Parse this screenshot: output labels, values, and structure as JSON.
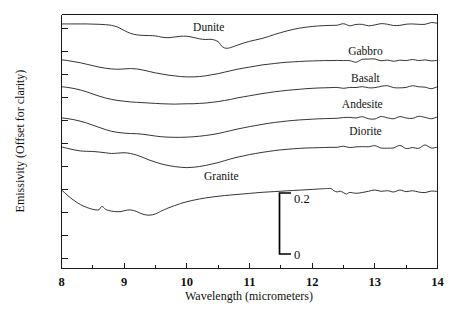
{
  "chart_data": {
    "type": "line",
    "title": "",
    "xlabel": "Wavelength (micrometers)",
    "ylabel": "Emissivity (Offset for clarity)",
    "xlim": [
      8,
      14
    ],
    "ylim": [
      0,
      1.4
    ],
    "grid": false,
    "legend_position": "inline-right",
    "xticks": [
      8,
      9,
      10,
      11,
      12,
      13,
      14
    ],
    "xtick_labels": [
      "8",
      "9",
      "10",
      "11",
      "12",
      "13",
      "14"
    ],
    "minor_xticks": [
      8.5,
      9.5,
      10.5,
      11.5,
      12.5,
      13.5
    ],
    "yticks_unlabeled": true,
    "scale_bar": {
      "top_label": "0.2",
      "bottom_label": "0",
      "span": 0.2,
      "x_position": 11.35
    },
    "annotations": [
      {
        "text": "Dunite",
        "x": 10.35,
        "y": 1.31
      },
      {
        "text": "Gabbro",
        "x": 12.85,
        "y": 1.175
      },
      {
        "text": "Basalt",
        "x": 12.85,
        "y": 1.03
      },
      {
        "text": "Andesite",
        "x": 12.8,
        "y": 0.885
      },
      {
        "text": "Diorite",
        "x": 12.85,
        "y": 0.735
      },
      {
        "text": "Granite",
        "x": 10.55,
        "y": 0.49
      }
    ],
    "series": [
      {
        "name": "Dunite",
        "color": "#111111",
        "offset": 1.2,
        "x": [
          8.0,
          8.1,
          8.2,
          8.3,
          8.4,
          8.5,
          8.6,
          8.7,
          8.8,
          8.9,
          9.0,
          9.1,
          9.2,
          9.3,
          9.4,
          9.5,
          9.6,
          9.7,
          9.8,
          9.9,
          10.0,
          10.1,
          10.2,
          10.3,
          10.4,
          10.5,
          10.55,
          10.6,
          10.65,
          10.7,
          10.8,
          10.9,
          11.0,
          11.1,
          11.2,
          11.3,
          11.4,
          11.5,
          11.6,
          11.7,
          11.8,
          11.9,
          12.0,
          12.1,
          12.2,
          12.3,
          12.4,
          12.5,
          12.6,
          12.7,
          12.8,
          12.9,
          13.0,
          13.1,
          13.2,
          13.3,
          13.4,
          13.5,
          13.6,
          13.7,
          13.8,
          13.9,
          14.0
        ],
        "y": [
          0.148,
          0.148,
          0.148,
          0.148,
          0.148,
          0.147,
          0.146,
          0.144,
          0.14,
          0.13,
          0.112,
          0.096,
          0.088,
          0.085,
          0.084,
          0.082,
          0.075,
          0.072,
          0.076,
          0.08,
          0.08,
          0.074,
          0.066,
          0.062,
          0.063,
          0.05,
          0.028,
          0.016,
          0.014,
          0.018,
          0.03,
          0.042,
          0.052,
          0.06,
          0.068,
          0.078,
          0.09,
          0.1,
          0.11,
          0.118,
          0.125,
          0.13,
          0.134,
          0.137,
          0.139,
          0.14,
          0.141,
          0.141,
          0.143,
          0.141,
          0.144,
          0.142,
          0.145,
          0.143,
          0.146,
          0.143,
          0.147,
          0.144,
          0.148,
          0.145,
          0.149,
          0.146,
          0.15
        ]
      },
      {
        "name": "Gabbro",
        "color": "#111111",
        "offset": 1.0,
        "x": [
          8.0,
          8.1,
          8.2,
          8.3,
          8.4,
          8.5,
          8.6,
          8.7,
          8.8,
          8.9,
          9.0,
          9.1,
          9.2,
          9.3,
          9.4,
          9.5,
          9.6,
          9.7,
          9.8,
          9.9,
          10.0,
          10.1,
          10.2,
          10.3,
          10.4,
          10.5,
          10.6,
          10.7,
          10.8,
          10.9,
          11.0,
          11.1,
          11.2,
          11.3,
          11.4,
          11.5,
          11.6,
          11.7,
          11.8,
          11.9,
          12.0,
          12.1,
          12.2,
          12.3,
          12.4,
          12.5,
          12.6,
          12.7,
          12.8,
          12.9,
          13.0,
          13.1,
          13.2,
          13.3,
          13.4,
          13.5,
          13.6,
          13.7,
          13.8,
          13.9,
          14.0
        ],
        "y": [
          0.15,
          0.146,
          0.14,
          0.134,
          0.126,
          0.118,
          0.11,
          0.104,
          0.1,
          0.098,
          0.1,
          0.102,
          0.1,
          0.094,
          0.086,
          0.078,
          0.072,
          0.066,
          0.062,
          0.058,
          0.056,
          0.056,
          0.058,
          0.062,
          0.068,
          0.074,
          0.082,
          0.09,
          0.098,
          0.104,
          0.11,
          0.116,
          0.122,
          0.126,
          0.13,
          0.134,
          0.137,
          0.139,
          0.141,
          0.143,
          0.144,
          0.145,
          0.146,
          0.146,
          0.147,
          0.147,
          0.149,
          0.146,
          0.15,
          0.147,
          0.15,
          0.147,
          0.151,
          0.148,
          0.151,
          0.148,
          0.152,
          0.147,
          0.153,
          0.148,
          0.153
        ]
      },
      {
        "name": "Basalt",
        "color": "#111111",
        "offset": 0.85,
        "x": [
          8.0,
          8.1,
          8.2,
          8.3,
          8.4,
          8.5,
          8.6,
          8.7,
          8.8,
          8.9,
          9.0,
          9.1,
          9.2,
          9.3,
          9.4,
          9.5,
          9.6,
          9.7,
          9.8,
          9.9,
          10.0,
          10.1,
          10.2,
          10.3,
          10.4,
          10.5,
          10.6,
          10.7,
          10.8,
          10.9,
          11.0,
          11.1,
          11.2,
          11.3,
          11.4,
          11.5,
          11.6,
          11.7,
          11.8,
          11.9,
          12.0,
          12.1,
          12.2,
          12.3,
          12.4,
          12.5,
          12.6,
          12.7,
          12.8,
          12.9,
          13.0,
          13.1,
          13.2,
          13.3,
          13.4,
          13.5,
          13.6,
          13.7,
          13.8,
          13.9,
          14.0
        ],
        "y": [
          0.152,
          0.148,
          0.142,
          0.134,
          0.124,
          0.112,
          0.1,
          0.09,
          0.082,
          0.076,
          0.072,
          0.068,
          0.066,
          0.064,
          0.062,
          0.06,
          0.058,
          0.057,
          0.056,
          0.057,
          0.058,
          0.058,
          0.06,
          0.062,
          0.066,
          0.07,
          0.076,
          0.082,
          0.09,
          0.096,
          0.102,
          0.108,
          0.114,
          0.119,
          0.124,
          0.128,
          0.132,
          0.135,
          0.138,
          0.141,
          0.143,
          0.145,
          0.146,
          0.147,
          0.148,
          0.148,
          0.15,
          0.147,
          0.151,
          0.148,
          0.151,
          0.148,
          0.152,
          0.149,
          0.152,
          0.148,
          0.153,
          0.148,
          0.153,
          0.149,
          0.154
        ]
      },
      {
        "name": "Andesite",
        "color": "#111111",
        "offset": 0.68,
        "x": [
          8.0,
          8.1,
          8.2,
          8.3,
          8.4,
          8.5,
          8.6,
          8.7,
          8.8,
          8.9,
          9.0,
          9.1,
          9.2,
          9.3,
          9.4,
          9.5,
          9.6,
          9.7,
          9.8,
          9.9,
          10.0,
          10.1,
          10.2,
          10.3,
          10.4,
          10.5,
          10.6,
          10.7,
          10.8,
          10.9,
          11.0,
          11.1,
          11.2,
          11.3,
          11.4,
          11.5,
          11.6,
          11.7,
          11.8,
          11.9,
          12.0,
          12.1,
          12.2,
          12.3,
          12.4,
          12.5,
          12.6,
          12.7,
          12.8,
          12.9,
          13.0,
          13.1,
          13.2,
          13.3,
          13.4,
          13.5,
          13.6,
          13.7,
          13.8,
          13.9,
          14.0
        ],
        "y": [
          0.15,
          0.146,
          0.14,
          0.132,
          0.122,
          0.11,
          0.098,
          0.086,
          0.076,
          0.07,
          0.066,
          0.064,
          0.063,
          0.06,
          0.055,
          0.05,
          0.046,
          0.044,
          0.043,
          0.043,
          0.044,
          0.046,
          0.049,
          0.053,
          0.058,
          0.064,
          0.072,
          0.08,
          0.088,
          0.095,
          0.102,
          0.108,
          0.114,
          0.12,
          0.125,
          0.129,
          0.133,
          0.136,
          0.139,
          0.141,
          0.143,
          0.145,
          0.146,
          0.147,
          0.148,
          0.149,
          0.151,
          0.148,
          0.152,
          0.149,
          0.152,
          0.149,
          0.153,
          0.149,
          0.153,
          0.15,
          0.154,
          0.149,
          0.154,
          0.15,
          0.155
        ]
      },
      {
        "name": "Diorite",
        "color": "#111111",
        "offset": 0.52,
        "x": [
          8.0,
          8.1,
          8.2,
          8.3,
          8.4,
          8.5,
          8.6,
          8.7,
          8.8,
          8.9,
          9.0,
          9.1,
          9.2,
          9.3,
          9.4,
          9.5,
          9.6,
          9.7,
          9.8,
          9.9,
          10.0,
          10.1,
          10.2,
          10.3,
          10.4,
          10.5,
          10.6,
          10.7,
          10.8,
          10.9,
          11.0,
          11.1,
          11.2,
          11.3,
          11.4,
          11.5,
          11.6,
          11.7,
          11.8,
          11.9,
          12.0,
          12.1,
          12.2,
          12.3,
          12.4,
          12.5,
          12.6,
          12.7,
          12.8,
          12.9,
          13.0,
          13.1,
          13.2,
          13.3,
          13.4,
          13.5,
          13.6,
          13.7,
          13.8,
          13.9,
          14.0
        ],
        "y": [
          0.15,
          0.142,
          0.134,
          0.128,
          0.126,
          0.125,
          0.122,
          0.118,
          0.114,
          0.116,
          0.118,
          0.114,
          0.105,
          0.092,
          0.078,
          0.066,
          0.056,
          0.048,
          0.042,
          0.038,
          0.036,
          0.038,
          0.042,
          0.048,
          0.056,
          0.064,
          0.074,
          0.084,
          0.093,
          0.1,
          0.108,
          0.114,
          0.12,
          0.125,
          0.13,
          0.134,
          0.137,
          0.14,
          0.142,
          0.144,
          0.145,
          0.146,
          0.147,
          0.148,
          0.148,
          0.149,
          0.151,
          0.148,
          0.152,
          0.149,
          0.152,
          0.149,
          0.153,
          0.148,
          0.155,
          0.146,
          0.156,
          0.148,
          0.154,
          0.15,
          0.155
        ]
      },
      {
        "name": "Granite",
        "color": "#111111",
        "offset": 0.28,
        "x": [
          8.0,
          8.05,
          8.1,
          8.15,
          8.2,
          8.25,
          8.3,
          8.35,
          8.4,
          8.45,
          8.5,
          8.55,
          8.6,
          8.62,
          8.65,
          8.68,
          8.7,
          8.75,
          8.8,
          8.85,
          8.9,
          8.95,
          9.0,
          9.05,
          9.1,
          9.15,
          9.2,
          9.25,
          9.3,
          9.35,
          9.4,
          9.45,
          9.5,
          9.55,
          9.6,
          9.7,
          9.8,
          9.9,
          10.0,
          10.1,
          10.2,
          10.3,
          10.4,
          10.5,
          10.6,
          10.7,
          10.8,
          10.9,
          11.0,
          11.1,
          11.2,
          11.3,
          11.4,
          11.5,
          11.6,
          11.7,
          11.8,
          11.9,
          12.0,
          12.1,
          12.2,
          12.25,
          12.3,
          12.35,
          12.4,
          12.45,
          12.5,
          12.55,
          12.6,
          12.7,
          12.8,
          12.9,
          13.0,
          13.1,
          13.2,
          13.3,
          13.4,
          13.5,
          13.6,
          13.7,
          13.8,
          13.9,
          14.0
        ],
        "y": [
          0.152,
          0.138,
          0.122,
          0.108,
          0.095,
          0.083,
          0.073,
          0.064,
          0.057,
          0.051,
          0.046,
          0.043,
          0.044,
          0.055,
          0.062,
          0.054,
          0.046,
          0.04,
          0.036,
          0.034,
          0.033,
          0.034,
          0.038,
          0.042,
          0.043,
          0.04,
          0.034,
          0.026,
          0.019,
          0.015,
          0.014,
          0.016,
          0.021,
          0.029,
          0.038,
          0.053,
          0.066,
          0.078,
          0.088,
          0.096,
          0.103,
          0.109,
          0.114,
          0.118,
          0.122,
          0.125,
          0.128,
          0.131,
          0.134,
          0.137,
          0.14,
          0.142,
          0.144,
          0.146,
          0.148,
          0.15,
          0.152,
          0.154,
          0.156,
          0.158,
          0.16,
          0.161,
          0.161,
          0.148,
          0.142,
          0.146,
          0.14,
          0.136,
          0.142,
          0.139,
          0.144,
          0.141,
          0.146,
          0.142,
          0.145,
          0.143,
          0.147,
          0.143,
          0.149,
          0.14,
          0.146,
          0.142,
          0.146
        ]
      }
    ]
  },
  "axes": {
    "x_title": "Wavelength (micrometers)",
    "y_title": "Emissivity (Offset for clarity)",
    "x_tick_labels": [
      "8",
      "9",
      "10",
      "11",
      "12",
      "13",
      "14"
    ]
  },
  "scale_bar": {
    "top": "0.2",
    "bottom": "0"
  },
  "curve_labels": {
    "dunite": "Dunite",
    "gabbro": "Gabbro",
    "basalt": "Basalt",
    "andesite": "Andesite",
    "diorite": "Diorite",
    "granite": "Granite"
  }
}
